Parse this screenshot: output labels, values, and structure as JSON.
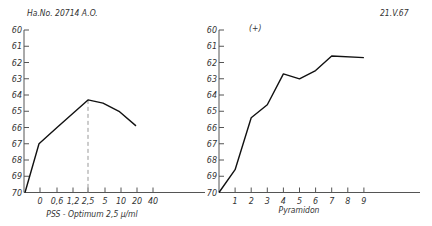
{
  "header": {
    "left_label": "Ha.No. 20714  A.O.",
    "right_label": "21.V.67",
    "panel2_label": "(+)"
  },
  "chart_data": [
    {
      "type": "line",
      "title": "",
      "annotation": "Ha.No. 20714  A.O.",
      "xlabel": "PSS - Optimum  2,5 μ/ml",
      "ylabel": "",
      "y_ticks": [
        "60",
        "61",
        "62",
        "63",
        "64",
        "65",
        "66",
        "67",
        "68",
        "69",
        "70"
      ],
      "ylim": [
        70,
        60
      ],
      "y_inverted": true,
      "x_ticks": [
        "0",
        "0,6",
        "1,2",
        "2,5",
        "5",
        "10",
        "20",
        "40"
      ],
      "x": [
        "start",
        "0",
        "0,6",
        "2,5",
        "5",
        "10",
        "20"
      ],
      "values": [
        70.0,
        67.0,
        66.0,
        64.3,
        64.5,
        65.0,
        65.9
      ],
      "marker_line": {
        "x": "2,5",
        "style": "dashed",
        "label": "Optimum"
      },
      "grid": false
    },
    {
      "type": "line",
      "title": "",
      "annotation": "(+)",
      "date": "21.V.67",
      "xlabel": "Pyramidon",
      "ylabel": "",
      "y_ticks": [
        "60",
        "61",
        "62",
        "63",
        "64",
        "65",
        "66",
        "67",
        "68",
        "69",
        "70"
      ],
      "ylim": [
        70,
        60
      ],
      "y_inverted": true,
      "x_ticks": [
        "1",
        "2",
        "3",
        "4",
        "5",
        "6",
        "7",
        "8",
        "9"
      ],
      "x": [
        0,
        1,
        2,
        3,
        4,
        5,
        6,
        7,
        9
      ],
      "values": [
        70.0,
        68.6,
        65.4,
        64.6,
        62.7,
        63.0,
        62.5,
        61.6,
        61.7
      ],
      "grid": false
    }
  ]
}
